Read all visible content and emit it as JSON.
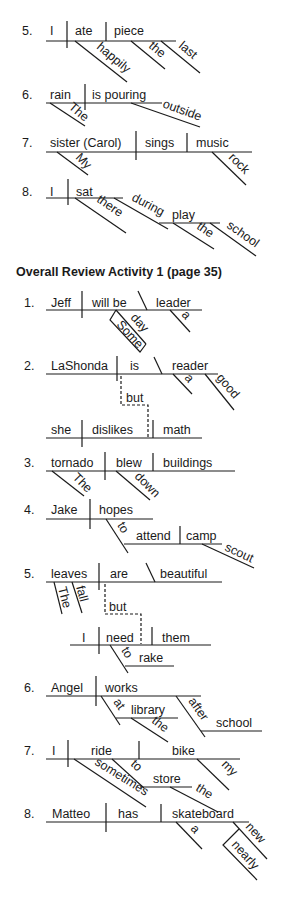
{
  "prior_section": {
    "items": [
      {
        "number": "5.",
        "subject": "I",
        "verb": "ate",
        "object": "piece",
        "modifiers": [
          "happily",
          "the",
          "last"
        ]
      },
      {
        "number": "6.",
        "subject": "rain",
        "verb": "is pouring",
        "modifiers": [
          "The",
          "outside"
        ]
      },
      {
        "number": "7.",
        "subject": "sister (Carol)",
        "verb": "sings",
        "object": "music",
        "modifiers": [
          "My",
          "rock"
        ]
      },
      {
        "number": "8.",
        "subject": "I",
        "verb": "sat",
        "modifiers": [
          "there",
          "during",
          "play",
          "the",
          "school"
        ]
      }
    ]
  },
  "heading": "Overall Review Activity 1 (page 35)",
  "review_items": [
    {
      "number": "1.",
      "subject": "Jeff",
      "verb": "will be",
      "complement": "leader",
      "modifiers": [
        "day",
        "Some",
        "a"
      ]
    },
    {
      "number": "2.",
      "subject": "LaShonda",
      "verb": "is",
      "complement": "reader",
      "modifiers": [
        "a",
        "good"
      ],
      "conjunction": "but",
      "clause2": {
        "subject": "she",
        "verb": "dislikes",
        "object": "math"
      }
    },
    {
      "number": "3.",
      "subject": "tornado",
      "verb": "blew",
      "object": "buildings",
      "modifiers": [
        "The",
        "down"
      ]
    },
    {
      "number": "4.",
      "subject": "Jake",
      "verb": "hopes",
      "infinitive": {
        "prep": "to",
        "verb": "attend",
        "object": "camp",
        "modifier": "scout"
      }
    },
    {
      "number": "5.",
      "subject": "leaves",
      "verb": "are",
      "complement": "beautiful",
      "modifiers": [
        "The",
        "fall"
      ],
      "conjunction": "but",
      "clause2": {
        "subject": "I",
        "verb": "need",
        "object": "them",
        "infinitive": {
          "prep": "to",
          "verb": "rake"
        }
      }
    },
    {
      "number": "6.",
      "subject": "Angel",
      "verb": "works",
      "phrases": [
        {
          "prep": "at",
          "object": "library",
          "modifier": "the"
        },
        {
          "prep": "after",
          "object": "school"
        }
      ]
    },
    {
      "number": "7.",
      "subject": "I",
      "verb": "ride",
      "object": "bike",
      "modifiers": [
        "sometimes",
        "my"
      ],
      "phrase": {
        "prep": "to",
        "object": "store",
        "modifier": "the"
      }
    },
    {
      "number": "8.",
      "subject": "Matteo",
      "verb": "has",
      "object": "skateboard",
      "modifiers": [
        "a",
        "new",
        "nearly"
      ]
    }
  ]
}
